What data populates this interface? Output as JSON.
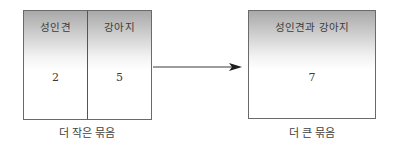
{
  "diagram": {
    "smaller_group": {
      "columns": [
        {
          "header": "성인견",
          "value": "2"
        },
        {
          "header": "강아지",
          "value": "5"
        }
      ],
      "caption": "더 작은 묶음"
    },
    "arrow": {
      "direction": "right",
      "color": "#3a3a3a"
    },
    "larger_group": {
      "header": "성인견과 강아지",
      "value": "7",
      "caption": "더 큰 묶음"
    },
    "colors": {
      "header_gradient_top": "#a9a9a9",
      "background": "#ffffff",
      "border": "#6a6a6a"
    }
  }
}
